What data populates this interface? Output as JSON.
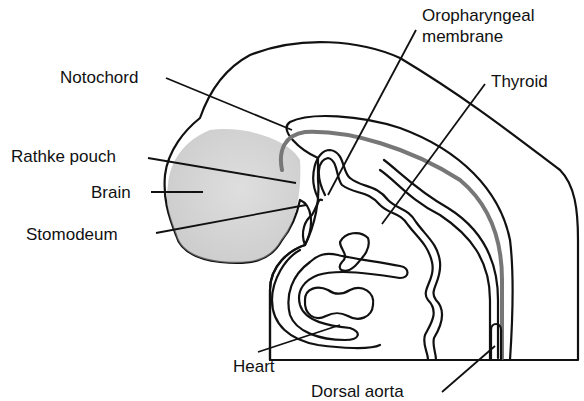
{
  "diagram": {
    "labels": {
      "notochord": "Notochord",
      "rathke_pouch": "Rathke pouch",
      "brain": "Brain",
      "stomodeum": "Stomodeum",
      "oropharyngeal_line1": "Oropharyngeal",
      "oropharyngeal_line2": "membrane",
      "thyroid": "Thyroid",
      "heart": "Heart",
      "dorsal_aorta": "Dorsal aorta"
    },
    "colors": {
      "body_fill": "#bdbdbd",
      "body_dark": "#9a9a9a",
      "inner_fill": "#c9c9c9",
      "heart_fill": "#8e8e8e",
      "notochord_stripe": "#7a7a7a",
      "outline": "#111111",
      "background": "#ffffff"
    }
  }
}
